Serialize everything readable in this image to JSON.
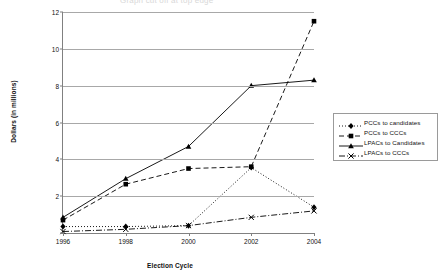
{
  "top_title": "Graph cut off at top edge",
  "chart_data": {
    "type": "line",
    "title": "",
    "xlabel": "Election Cycle",
    "ylabel": "Dollars (in millions)",
    "categories": [
      "1996",
      "1998",
      "2000",
      "2002",
      "2004"
    ],
    "ylim": [
      0,
      12
    ],
    "yticks": [
      0,
      2,
      4,
      6,
      8,
      10,
      12
    ],
    "ytick_labels": [
      "",
      "2",
      "4",
      "6",
      "8",
      "10",
      "12"
    ],
    "grid": true,
    "legend_position": "right",
    "series": [
      {
        "name": "PCCs to candidates",
        "values": [
          0.35,
          0.35,
          0.4,
          3.55,
          1.4
        ],
        "marker": "diamond",
        "dash": "dotted",
        "color": "#000000"
      },
      {
        "name": "PCCs to CCCs",
        "values": [
          0.7,
          2.65,
          3.5,
          3.6,
          11.5
        ],
        "marker": "square",
        "dash": "dashed",
        "color": "#000000"
      },
      {
        "name": "LPACs to Candidates",
        "values": [
          0.85,
          2.95,
          4.7,
          8.0,
          8.3
        ],
        "marker": "triangle",
        "dash": "solid",
        "color": "#000000"
      },
      {
        "name": "LPACs to CCCs",
        "values": [
          0.08,
          0.2,
          0.4,
          0.85,
          1.2
        ],
        "marker": "cross",
        "dash": "dashdot",
        "color": "#000000"
      }
    ]
  }
}
